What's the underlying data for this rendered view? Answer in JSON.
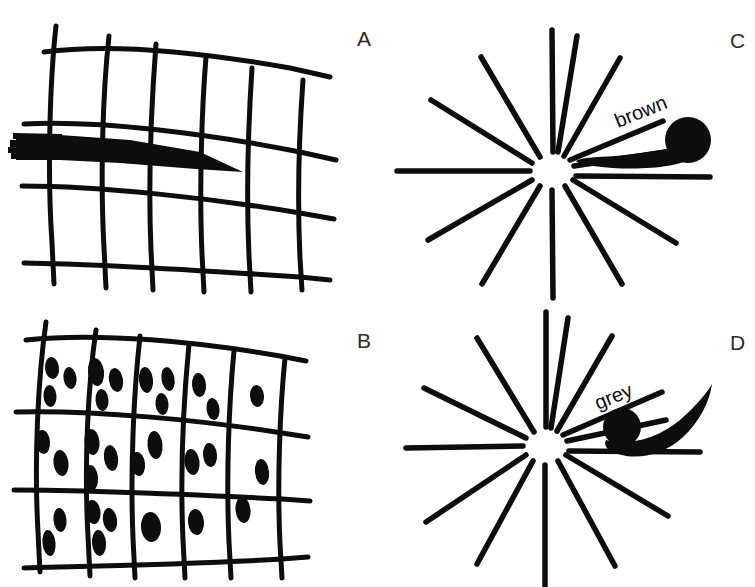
{
  "figure": {
    "background_color": "#ffffff",
    "ink_color": "#0d0d0d",
    "label_color": "#2b2b2b",
    "width": 755,
    "height": 587
  },
  "panels": [
    {
      "id": "A",
      "letter": "A",
      "kind": "grid-with-streak",
      "description": "Hand drawn curvilinear grid overlaid by a solid tapering dark streak",
      "letter_position": {
        "x": 357,
        "y": 28
      },
      "grid": {
        "horizontal_lines": 4,
        "vertical_lines": 6,
        "line_width_px": 5,
        "style": "hand-drawn wobble"
      },
      "streak": {
        "shape": "tapering wedge",
        "thick_end": "left",
        "point_end": "right",
        "frayed_edge": "left"
      }
    },
    {
      "id": "B",
      "letter": "B",
      "kind": "grid-with-spots",
      "description": "Hand drawn curvilinear grid with dark elliptical spots scattered inside the cells",
      "letter_position": {
        "x": 357,
        "y": 330
      },
      "grid": {
        "horizontal_lines": 4,
        "vertical_lines": 6,
        "line_width_px": 5,
        "style": "hand-drawn wobble"
      },
      "spots": {
        "count": 42,
        "shape": "vertical ellipse",
        "typical_size_px": [
          12,
          21
        ]
      }
    },
    {
      "id": "C",
      "letter": "C",
      "kind": "starburst-with-blob",
      "description": "Radial starburst of straight rays with a tadpole shaped blob at the right labelled brown",
      "letter_position": {
        "x": 730,
        "y": 30
      },
      "starburst": {
        "center": {
          "x": 553,
          "y": 170
        },
        "ray_count": 14,
        "inner_gap_px": 18,
        "outer_radius_px": 148
      },
      "blob": {
        "label": "brown",
        "label_rotation_deg": -22,
        "head": "large filled circle",
        "tail": "tapering, sweeping left",
        "head_diameter_px": 44
      }
    },
    {
      "id": "D",
      "letter": "D",
      "kind": "starburst-with-blob",
      "description": "Radial starburst of straight rays with a smaller comma shaped blob at the right labelled grey",
      "letter_position": {
        "x": 730,
        "y": 332
      },
      "starburst": {
        "center": {
          "x": 546,
          "y": 445
        },
        "ray_count": 14,
        "inner_gap_px": 18,
        "outer_radius_px": 142
      },
      "blob": {
        "label": "grey",
        "label_rotation_deg": -22,
        "head": "filled circle",
        "tail": "long curved crescent sweeping up to the right",
        "head_diameter_px": 36
      }
    }
  ],
  "labels": {
    "panel_a": "A",
    "panel_b": "B",
    "panel_c": "C",
    "panel_d": "D",
    "blob_brown": "brown",
    "blob_grey": "grey"
  }
}
